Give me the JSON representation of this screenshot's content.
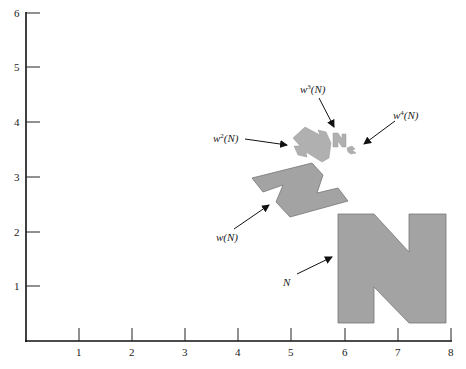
{
  "figure": {
    "x_ticks": [
      "1",
      "2",
      "3",
      "4",
      "5",
      "6",
      "7",
      "8"
    ],
    "y_ticks": [
      "1",
      "2",
      "3",
      "4",
      "5",
      "6"
    ],
    "labels": {
      "N": "N",
      "wN": "w(N)",
      "w2N_base": "w",
      "w2N_exp": "2",
      "w2N_rest": "(N)",
      "w3N_base": "w",
      "w3N_exp": "3",
      "w3N_rest": "(N)",
      "w4N_base": "w",
      "w4N_exp": "4",
      "w4N_rest": "(N)"
    },
    "colors": {
      "shape_fill": "#a3a3a3",
      "axis": "#111111"
    }
  }
}
